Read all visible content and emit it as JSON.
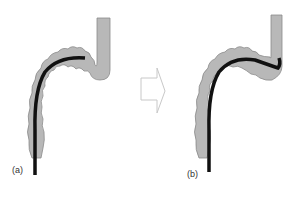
{
  "diagram": {
    "type": "medical-illustration",
    "panels": [
      {
        "id": "a",
        "label": "(a)"
      },
      {
        "id": "b",
        "label": "(b)"
      }
    ],
    "arrow": {
      "direction": "right",
      "style": "outline"
    },
    "colors": {
      "colon_fill": "#b8b8b8",
      "colon_stroke": "#8a8a8a",
      "scope": "#111111",
      "arrow_stroke": "#c8c8c8",
      "background": "#ffffff"
    }
  }
}
